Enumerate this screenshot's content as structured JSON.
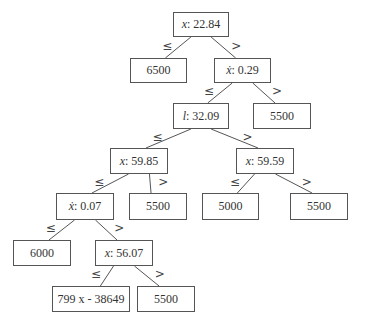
{
  "diagram": {
    "type": "decision-tree",
    "edge_labels": {
      "left": "≤",
      "right": ">"
    },
    "nodes": [
      {
        "id": "n0",
        "kind": "split",
        "var": "x",
        "dot": false,
        "sep": ": ",
        "value": "22.84",
        "box": [
          173,
          12,
          56,
          25
        ]
      },
      {
        "id": "n1",
        "kind": "leaf",
        "text": "6500",
        "box": [
          130,
          58,
          57,
          25
        ]
      },
      {
        "id": "n2",
        "kind": "split",
        "var": "ẋ",
        "dot": true,
        "sep": ": ",
        "value": "0.29",
        "box": [
          214,
          58,
          57,
          25
        ]
      },
      {
        "id": "n3",
        "kind": "split",
        "var": "l",
        "dot": false,
        "sep": ": ",
        "value": "32.09",
        "box": [
          173,
          103,
          56,
          26
        ]
      },
      {
        "id": "n4",
        "kind": "leaf",
        "text": "5500",
        "box": [
          253,
          103,
          58,
          26
        ]
      },
      {
        "id": "n5",
        "kind": "split",
        "var": "x",
        "dot": false,
        "sep": ": ",
        "value": "59.85",
        "box": [
          110,
          148,
          58,
          26
        ]
      },
      {
        "id": "n6",
        "kind": "split",
        "var": "x",
        "dot": false,
        "sep": ": ",
        "value": "59.59",
        "box": [
          236,
          148,
          58,
          26
        ]
      },
      {
        "id": "n7",
        "kind": "split",
        "var": "ẋ",
        "dot": true,
        "sep": ": ",
        "value": "0.07",
        "box": [
          56,
          193,
          58,
          27
        ]
      },
      {
        "id": "n8",
        "kind": "leaf",
        "text": "5500",
        "box": [
          129,
          193,
          58,
          27
        ]
      },
      {
        "id": "n9",
        "kind": "leaf",
        "text": "5000",
        "box": [
          202,
          193,
          57,
          27
        ]
      },
      {
        "id": "n10",
        "kind": "leaf",
        "text": "5500",
        "box": [
          290,
          193,
          58,
          27
        ]
      },
      {
        "id": "n11",
        "kind": "leaf",
        "text": "6000",
        "box": [
          13,
          240,
          58,
          26
        ]
      },
      {
        "id": "n12",
        "kind": "split",
        "var": "x",
        "dot": false,
        "sep": ": ",
        "value": "56.07",
        "box": [
          95,
          240,
          58,
          26
        ]
      },
      {
        "id": "n13",
        "kind": "leaf",
        "text": "799 x - 38649",
        "box": [
          52,
          286,
          78,
          26
        ]
      },
      {
        "id": "n14",
        "kind": "leaf",
        "text": "5500",
        "box": [
          137,
          286,
          58,
          26
        ]
      }
    ],
    "edges": [
      {
        "from": "n0",
        "to": "n1",
        "label": "≤",
        "side": "left"
      },
      {
        "from": "n0",
        "to": "n2",
        "label": ">",
        "side": "right"
      },
      {
        "from": "n2",
        "to": "n3",
        "label": "≤",
        "side": "left"
      },
      {
        "from": "n2",
        "to": "n4",
        "label": ">",
        "side": "right"
      },
      {
        "from": "n3",
        "to": "n5",
        "label": "≤",
        "side": "left"
      },
      {
        "from": "n3",
        "to": "n6",
        "label": ">",
        "side": "right"
      },
      {
        "from": "n5",
        "to": "n7",
        "label": "≤",
        "side": "left"
      },
      {
        "from": "n5",
        "to": "n8",
        "label": ">",
        "side": "right"
      },
      {
        "from": "n6",
        "to": "n9",
        "label": "≤",
        "side": "left"
      },
      {
        "from": "n6",
        "to": "n10",
        "label": ">",
        "side": "right"
      },
      {
        "from": "n7",
        "to": "n11",
        "label": "≤",
        "side": "left"
      },
      {
        "from": "n7",
        "to": "n12",
        "label": ">",
        "side": "right"
      },
      {
        "from": "n12",
        "to": "n13",
        "label": "≤",
        "side": "left"
      },
      {
        "from": "n12",
        "to": "n14",
        "label": ">",
        "side": "right"
      }
    ]
  },
  "colors": {
    "background": "#ffffff",
    "border": "#555555",
    "line": "#555555",
    "text": "#333333"
  }
}
